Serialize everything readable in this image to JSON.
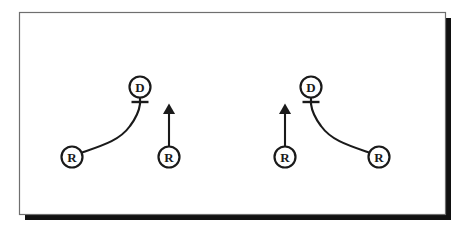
{
  "figure": {
    "title": "Football play diagram - two mirrored receiver route concepts",
    "canvas": {
      "width": 472,
      "height": 234
    },
    "background_color": "#ffffff",
    "ink_color": "#1a1a1a",
    "frame": {
      "name": "diagram-frame",
      "x": 19,
      "y": 12,
      "width": 426,
      "height": 202,
      "border_color": "#6f6f6f",
      "border_width": 1.2,
      "fill": "#ffffff",
      "shadow_color": "#111111",
      "shadow_offset_x": 6,
      "shadow_offset_y": 6,
      "shadow_thickness": 5
    },
    "symbol_style": {
      "circle_radius": 10.5,
      "circle_stroke_width": 2.2,
      "label_font_size": 13,
      "label_font_weight": "bold",
      "route_stroke_width": 2.1,
      "stem_stroke_width": 2.2,
      "bar_length": 17,
      "bar_stroke_width": 2.4,
      "arrow_head_width": 8,
      "arrow_head_length": 11
    },
    "panels": [
      {
        "name": "left-concept",
        "label": "Left concept",
        "players": [
          {
            "name": "left-defender-d",
            "role": "defender",
            "label": "D",
            "cx": 140,
            "cy": 87,
            "has_stop_bar": true,
            "bar_y": 102
          },
          {
            "name": "left-outside-receiver-r",
            "role": "receiver",
            "label": "R",
            "cx": 72,
            "cy": 157,
            "has_stop_bar": false
          },
          {
            "name": "left-inside-receiver-r",
            "role": "receiver",
            "label": "R",
            "cx": 169,
            "cy": 157,
            "has_stop_bar": false
          }
        ],
        "routes": [
          {
            "name": "left-curved-route",
            "type": "curve",
            "from_player": "left-outside-receiver-r",
            "to_player": "left-defender-d",
            "has_arrow_head": false,
            "path": "M 82.2 152.5 C 104 145 120 140 130 126 C 136 118 139 112 140 104"
          },
          {
            "name": "left-vertical-arrow-route",
            "type": "straight-arrow",
            "from_player": "left-inside-receiver-r",
            "has_arrow_head": true,
            "x": 169,
            "y_start": 146,
            "y_end": 114
          }
        ],
        "stems": [
          {
            "name": "left-defender-stem",
            "x": 140,
            "y_start": 97.5,
            "y_end": 104
          }
        ]
      },
      {
        "name": "right-concept",
        "label": "Right concept",
        "players": [
          {
            "name": "right-defender-d",
            "role": "defender",
            "label": "D",
            "cx": 311,
            "cy": 87,
            "has_stop_bar": true,
            "bar_y": 102
          },
          {
            "name": "right-outside-receiver-r",
            "role": "receiver",
            "label": "R",
            "cx": 379,
            "cy": 157,
            "has_stop_bar": false
          },
          {
            "name": "right-inside-receiver-r",
            "role": "receiver",
            "label": "R",
            "cx": 285,
            "cy": 157,
            "has_stop_bar": false
          }
        ],
        "routes": [
          {
            "name": "right-curved-route",
            "type": "curve",
            "from_player": "right-outside-receiver-r",
            "to_player": "right-defender-d",
            "has_arrow_head": false,
            "path": "M 368.8 152.5 C 347 145 331 140 321 126 C 315 118 312 112 311 104"
          },
          {
            "name": "right-vertical-arrow-route",
            "type": "straight-arrow",
            "from_player": "right-inside-receiver-r",
            "has_arrow_head": true,
            "x": 285,
            "y_start": 146,
            "y_end": 114
          }
        ],
        "stems": [
          {
            "name": "right-defender-stem",
            "x": 311,
            "y_start": 97.5,
            "y_end": 104
          }
        ]
      }
    ],
    "legend_semantics": {
      "D": "Defender",
      "R": "Receiver"
    }
  }
}
